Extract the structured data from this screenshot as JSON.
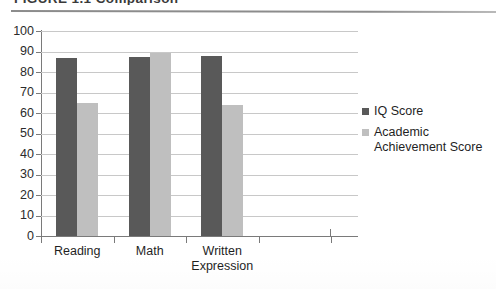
{
  "figure": {
    "title": "FIGURE 1.1  Comparison",
    "title_visible_note": "cropped at top edge"
  },
  "chart_data": {
    "type": "bar",
    "title": "",
    "xlabel": "",
    "ylabel": "",
    "categories": [
      "Reading",
      "Math",
      "Written Expression"
    ],
    "category_lines": [
      [
        "Reading"
      ],
      [
        "Math"
      ],
      [
        "Written",
        "Expression"
      ]
    ],
    "series": [
      {
        "name": "IQ Score",
        "color": "#595959",
        "values": [
          87,
          87.5,
          88
        ]
      },
      {
        "name": "Academic Achievement Score",
        "color": "#bfbfbf",
        "values": [
          65,
          89.5,
          64
        ]
      }
    ],
    "ylim": [
      0,
      100
    ],
    "ytick_step": 10,
    "yticks": [
      0,
      10,
      20,
      30,
      40,
      50,
      60,
      70,
      80,
      90,
      100
    ],
    "ytick_labels": [
      "0",
      "10",
      "20",
      "30",
      "40",
      "50",
      "60",
      "70",
      "80",
      "90",
      "100"
    ],
    "grid": true,
    "grid_axis": "y",
    "legend_position": "right",
    "empty_trailing_category_slot": true
  },
  "legend": {
    "items": [
      {
        "label": "IQ Score",
        "color": "#595959"
      },
      {
        "label": "Academic Achievement Score",
        "line1": "Academic",
        "line2": "Achievement Score",
        "color": "#bfbfbf"
      }
    ]
  },
  "colors": {
    "series_iq": "#595959",
    "series_achievement": "#bfbfbf",
    "gridline": "#c8c8c8",
    "axis": "#7a7a7a",
    "text": "#1f1f1f",
    "rule": "#8c8c8c",
    "background": "#ffffff"
  }
}
